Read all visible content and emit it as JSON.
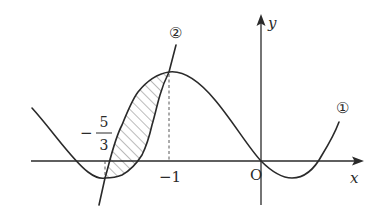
{
  "figure": {
    "type": "graph-of-functions",
    "axes": {
      "x_label": "x",
      "y_label": "y",
      "origin_label": "O"
    },
    "curves": [
      {
        "id": "curve-1",
        "label": "①",
        "kind": "quartic-like curve with local max at x = -1, passes through origin"
      },
      {
        "id": "curve-2",
        "label": "②",
        "kind": "curve through the intersection points at x = -5/3 and x = -1"
      }
    ],
    "tick_labels": {
      "minus_one": "−1",
      "minus_five_thirds": {
        "sign": "−",
        "numerator": "5",
        "denominator": "3"
      }
    },
    "shaded_region": {
      "description": "hatched region between curve ① and curve ② from x = -5/3 to x = -1",
      "x_from": "-5/3",
      "x_to": "-1"
    },
    "colors": {
      "stroke": "#2a2a2a",
      "background": "#ffffff",
      "hatch": "#555555"
    }
  }
}
